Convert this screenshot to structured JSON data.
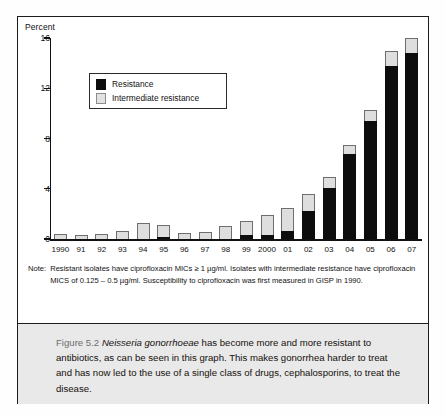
{
  "chart_data": {
    "type": "bar",
    "title": "",
    "subtitle": "",
    "xlabel": "",
    "ylabel": "Percent",
    "ylim": [
      0,
      16
    ],
    "yticks": [
      0,
      4,
      8,
      12,
      16
    ],
    "grid": false,
    "stacked": true,
    "legend_position": "inside-top-left",
    "categories": [
      "1990",
      "91",
      "92",
      "93",
      "94",
      "95",
      "96",
      "97",
      "98",
      "99",
      "2000",
      "01",
      "02",
      "03",
      "04",
      "05",
      "06",
      "07"
    ],
    "series": [
      {
        "name": "Resistance",
        "color": "#0d0d0d",
        "values": [
          0,
          0,
          0,
          0,
          0,
          0.15,
          0,
          0,
          0,
          0.3,
          0.3,
          0.6,
          2.2,
          4.1,
          6.8,
          9.4,
          13.8,
          14.8
        ]
      },
      {
        "name": "Intermediate resistance",
        "color": "#dedede",
        "values": [
          0.4,
          0.35,
          0.4,
          0.65,
          1.3,
          0.95,
          0.45,
          0.55,
          1.0,
          1.1,
          1.6,
          1.9,
          1.4,
          0.8,
          0.7,
          0.9,
          1.2,
          1.2
        ]
      }
    ],
    "totals": [
      0.4,
      0.35,
      0.4,
      0.65,
      1.3,
      1.1,
      0.45,
      0.55,
      1.0,
      1.4,
      1.9,
      2.5,
      3.6,
      4.9,
      7.5,
      10.3,
      15.0,
      16.0
    ],
    "annotations": []
  },
  "axis": {
    "y_title": "Percent",
    "y_tick_labels": [
      "16",
      "12",
      "8",
      "4",
      "0"
    ],
    "x_tick_labels": [
      "1990",
      "91",
      "92",
      "93",
      "94",
      "95",
      "96",
      "97",
      "98",
      "99",
      "2000",
      "01",
      "02",
      "03",
      "04",
      "05",
      "06",
      "07"
    ]
  },
  "legend": {
    "items": [
      {
        "label": "Resistance",
        "swatch": "black-square-swatch"
      },
      {
        "label": "Intermediate resistance",
        "swatch": "gray-square-swatch"
      }
    ]
  },
  "note": {
    "label": "Note:",
    "text": "Resistant isolates have ciprofloxacin MICs ≥ 1 µg/ml. Isolates with intermediate resistance have ciprofloxacin MICS of 0.125 – 0.5 µg/ml. Susceptibility to ciprofloxacin was first measured in GISP in 1990."
  },
  "caption": {
    "figure_number": "Figure 5.2",
    "species": "Neisseria gonorrhoeae",
    "body": " has become more and more resistant to antibiotics, as can be seen in this graph. This makes gonorrhea harder to treat and has now led to the use of a single class of drugs, cephalosporins, to treat the disease."
  },
  "colors": {
    "resistance": "#0d0d0d",
    "intermediate": "#dedede",
    "intermediate_border": "#6e6e6e",
    "frame": "#1c1c1c",
    "caption_band": "#e9e9e9",
    "figure_number": "#6d6d6d"
  }
}
